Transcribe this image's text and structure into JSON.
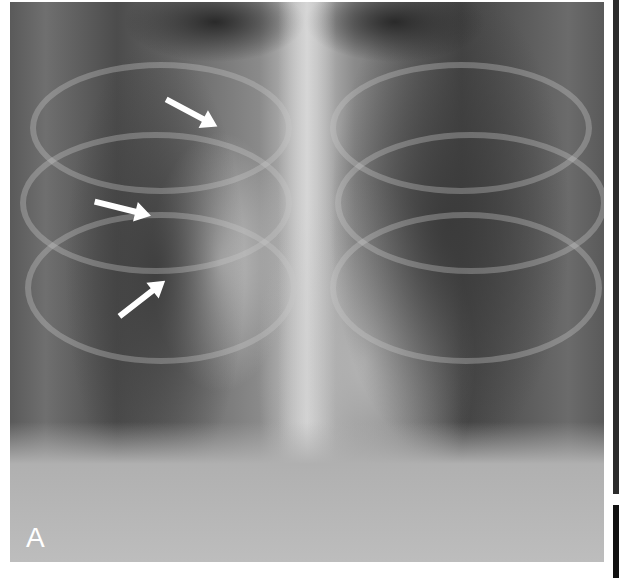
{
  "figure": {
    "panel_label": "A",
    "annotations": [
      {
        "type": "arrow",
        "direction": "down-right",
        "icon": "arrow-icon"
      },
      {
        "type": "arrow",
        "direction": "right",
        "icon": "arrow-icon"
      },
      {
        "type": "arrow",
        "direction": "up-right",
        "icon": "arrow-icon"
      }
    ],
    "colors": {
      "arrow": "#ffffff",
      "label": "#ffffff",
      "background": "#ffffff"
    }
  }
}
